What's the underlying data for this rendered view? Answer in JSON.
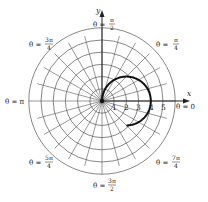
{
  "figure": {
    "axes": {
      "x_label": "x",
      "y_label": "y"
    },
    "radial_ticks": [
      "1",
      "2",
      "3",
      "4",
      "5"
    ],
    "angle_labels": [
      {
        "name": "theta-0",
        "text": "θ = 0"
      },
      {
        "name": "theta-pi-4",
        "prefix": "θ = ",
        "num": "π",
        "den": "4"
      },
      {
        "name": "theta-pi-2",
        "prefix": "θ = ",
        "num": "π",
        "den": "2"
      },
      {
        "name": "theta-3pi-4",
        "prefix": "θ = ",
        "num": "3π",
        "den": "4"
      },
      {
        "name": "theta-pi",
        "text": "θ = π"
      },
      {
        "name": "theta-5pi-4",
        "prefix": "θ = ",
        "num": "5π",
        "den": "4"
      },
      {
        "name": "theta-3pi-2",
        "prefix": "θ = ",
        "num": "3π",
        "den": "2"
      },
      {
        "name": "theta-7pi-4",
        "prefix": "θ = ",
        "num": "7π",
        "den": "4"
      }
    ],
    "grid": {
      "circles": 6,
      "spoke_step_deg": 15
    },
    "colors": {
      "grid": "#555555",
      "curve": "#111111",
      "text": "#222222"
    }
  },
  "chart_data": {
    "type": "polar",
    "title": "",
    "curve": "r = 4cos θ",
    "theta_range_deg": [
      -45,
      90
    ],
    "r_max": 6,
    "radial_ticks": [
      1,
      2,
      3,
      4,
      5
    ],
    "angle_labels": [
      "0",
      "π/4",
      "π/2",
      "3π/4",
      "π",
      "5π/4",
      "3π/2",
      "7π/4"
    ],
    "grid": true
  }
}
